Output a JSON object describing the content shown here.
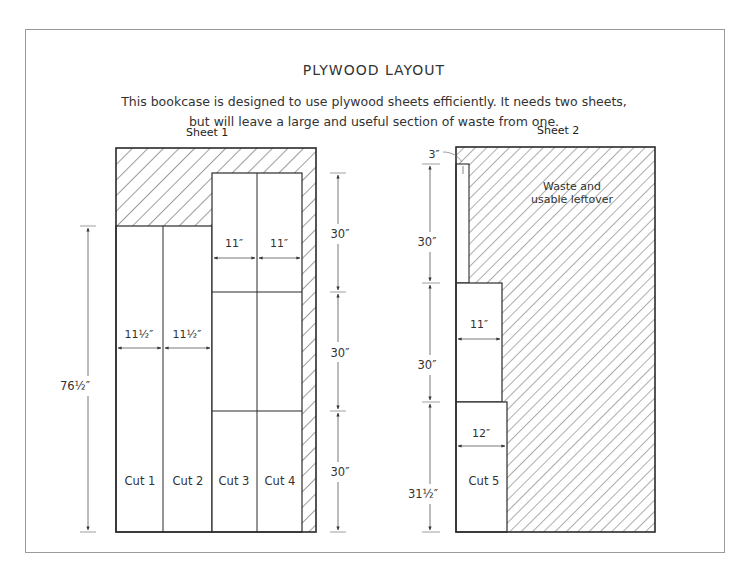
{
  "title": "PLYWOOD LAYOUT",
  "description": {
    "line1": "This bookcase is designed to use plywood sheets efficiently. It needs two sheets,",
    "line2": "but will leave a large and useful section of waste from one."
  },
  "sheet1": {
    "label": "Sheet 1",
    "cuts": [
      "Cut 1",
      "Cut 2",
      "Cut 3",
      "Cut 4"
    ],
    "dims": {
      "cut1_width": "11½″",
      "cut2_width": "11½″",
      "cut3_width": "11″",
      "cut4_width": "11″",
      "left_height": "76½″",
      "right_top": "30″",
      "right_mid": "30″",
      "right_bottom": "30″"
    }
  },
  "sheet2": {
    "label": "Sheet 2",
    "cuts": [
      "Cut 5"
    ],
    "waste_label_line1": "Waste and",
    "waste_label_line2": "usable leftover",
    "dims": {
      "strip_width": "3″",
      "top_height": "30″",
      "mid_width": "11″",
      "mid_height": "30″",
      "bottom_width": "12″",
      "bottom_height": "31½″"
    }
  },
  "colors": {
    "line": "#2a2a2a",
    "hatch": "#3a3a3a",
    "dim_line": "#666666",
    "frame": "#9a9a9a"
  }
}
